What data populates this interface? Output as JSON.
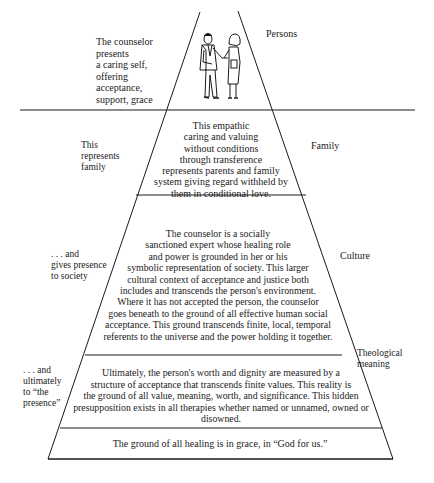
{
  "diagram": {
    "type": "pyramid",
    "levels": [
      {
        "name": "Persons",
        "left_label": "The counselor\npresents\na caring self,\noffering\nacceptance,\nsupport, grace",
        "left_lines": [
          "The counselor",
          "presents",
          "a caring self,",
          "offering",
          "acceptance,",
          "support, grace"
        ],
        "right_label": "Persons",
        "illustration": "counselor-and-client-figures"
      },
      {
        "name": "Family",
        "left_lines": [
          "This",
          "represents",
          "family"
        ],
        "right_label": "Family",
        "center_lines": [
          "This empathic",
          "caring and valuing",
          "without conditions",
          "through transference",
          "represents parents and family",
          "system giving regard withheld by",
          "them in conditional love."
        ]
      },
      {
        "name": "Culture",
        "left_lines": [
          ". . . and",
          "gives presence",
          "to society"
        ],
        "right_label": "Culture",
        "center_lines": [
          "The counselor is a socially",
          "sanctioned expert whose healing role",
          "and power is grounded in her or his",
          "symbolic representation of society. This larger",
          "cultural context of acceptance and justice both",
          "includes and transcends the person's environment.",
          "Where it has not accepted the person, the counselor",
          "goes beneath to the ground of all effective human social",
          "acceptance. This ground transcends finite, local, temporal",
          "referents to the universe and the power holding it together."
        ]
      },
      {
        "name": "Theological meaning",
        "left_lines": [
          ". . . and",
          "ultimately",
          "to “the",
          "presence”"
        ],
        "right_lines": [
          "Theological",
          "meaning"
        ],
        "center_lines": [
          "Ultimately, the person's worth and dignity are measured by a",
          "structure of acceptance that transcends finite values. This reality is",
          "the ground of all value, meaning, worth, and significance. This hidden",
          "presupposition exists in all therapies whether named or unnamed, owned or",
          "disowned."
        ]
      },
      {
        "name": "Ground",
        "center_lines": [
          "The ground of all healing is in grace, in “God for us.”"
        ]
      }
    ]
  }
}
